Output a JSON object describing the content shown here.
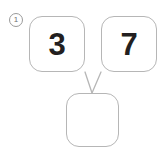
{
  "worksheet": {
    "problem_number": "1",
    "background_color": "#ffffff",
    "box_border_color": "#b6b6b6",
    "digit_color": "#231f20",
    "connector_color": "#b6b6b6"
  },
  "number_bond": {
    "type": "number-bond",
    "addend_left": "3",
    "addend_right": "7",
    "sum": "",
    "sum_placeholder": ""
  }
}
